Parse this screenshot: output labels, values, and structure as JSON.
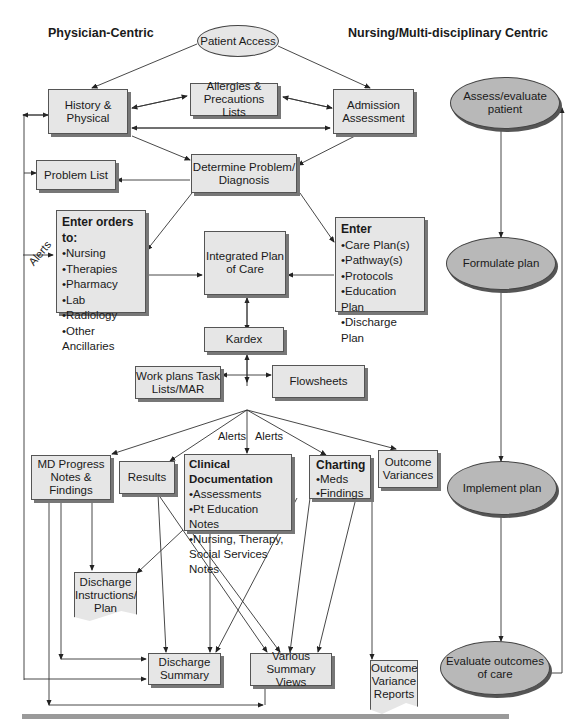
{
  "headers": {
    "left": "Physician-Centric",
    "right": "Nursing/Multi-disciplinary Centric"
  },
  "nodes": {
    "patient_access": "Patient Access",
    "history_physical": "History & Physical",
    "allergies": "Allergies & Precautions Lists",
    "admission_assessment": "Admission Assessment",
    "problem_list": "Problem List",
    "determine_problem": "Determine Problem/ Diagnosis",
    "enter_orders": {
      "title": "Enter orders to:",
      "items": [
        "Nursing",
        "Therapies",
        "Pharmacy",
        "Lab",
        "Radiology",
        "Other Ancillaries"
      ]
    },
    "integrated_plan": "Integrated Plan of Care",
    "enter_plans": {
      "title": "Enter",
      "items": [
        "Care Plan(s)",
        "Pathway(s)",
        "Protocols",
        "Education Plan",
        "Discharge Plan"
      ]
    },
    "kardex": "Kardex",
    "work_plans": "Work plans Task Lists/MAR",
    "flowsheets": "Flowsheets",
    "md_progress": "MD Progress Notes & Findings",
    "results": "Results",
    "clinical_doc": {
      "title": "Clinical Documentation",
      "items": [
        "Assessments",
        "Pt Education Notes",
        "Nursing, Therapy, Social Services Notes"
      ]
    },
    "charting": {
      "title": "Charting",
      "items": [
        "Meds",
        "Findings"
      ]
    },
    "outcome_variances": "Outcome Variances",
    "discharge_instructions": "Discharge Instructions/ Plan",
    "discharge_summary": "Discharge Summary",
    "various_summary": "Various Summary Views",
    "outcome_reports": "Outcome Variance Reports"
  },
  "cycle": {
    "assess": "Assess/evaluate patient",
    "formulate": "Formulate plan",
    "implement": "Implement plan",
    "evaluate": "Evaluate outcomes of care"
  },
  "labels": {
    "alerts_left": "Alerts",
    "alerts_mid1": "Alerts",
    "alerts_mid2": "Alerts"
  },
  "colors": {
    "box_fill": "#e6e6e6",
    "cycle_fill": "#b8b8b8",
    "line": "#333333",
    "rule": "#9a9a9a"
  }
}
